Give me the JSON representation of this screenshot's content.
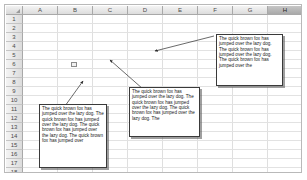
{
  "app": {
    "type": "spreadsheet",
    "selected_column": "H",
    "active_cell": "B6"
  },
  "grid": {
    "columns": [
      "A",
      "B",
      "C",
      "D",
      "E",
      "F",
      "G",
      "H",
      "I"
    ],
    "rows": [
      "1",
      "2",
      "3",
      "4",
      "5",
      "6",
      "7",
      "8",
      "9",
      "10",
      "11",
      "12",
      "13",
      "14",
      "15",
      "16",
      "17",
      "18"
    ],
    "corner_label": ""
  },
  "colors": {
    "grid_line": "#dfdfdf",
    "header_fill": "#e8e8e8",
    "header_selected": "#b5b5b5",
    "textbox_border": "#3a3a3a",
    "textbox_fill": "#ffffff",
    "connector": "#2a2a2a"
  },
  "textboxes": [
    {
      "id": "textbox-top-right",
      "text": "The quick brown fox has jumped over the lazy dog.   The quick brown fox has jumped over the lazy dog.  The quick brown fox has jumped over the"
    },
    {
      "id": "textbox-middle",
      "text": "The quick brown fox has jumped over the lazy dog.   The quick brown fox has jumped over the lazy dog.   The quick brown fox has jumped over the lazy dog.   The"
    },
    {
      "id": "textbox-bottom-left",
      "text": "The quick brown fox has jumped over the lazy dog.   The quick brown fox has jumped over the lazy dog.   The quick brown fox has jumped over the lazy dog.   The quick brown fox has jumped over"
    }
  ],
  "connectors": [
    {
      "id": "connector-top-right",
      "from": "textbox-top-right",
      "arrow_at": "left"
    },
    {
      "id": "connector-middle",
      "from": "textbox-middle",
      "arrow_at": "upper-left"
    },
    {
      "id": "connector-bottom-left",
      "from": "textbox-bottom-left",
      "arrow_at": "upper-right"
    }
  ]
}
